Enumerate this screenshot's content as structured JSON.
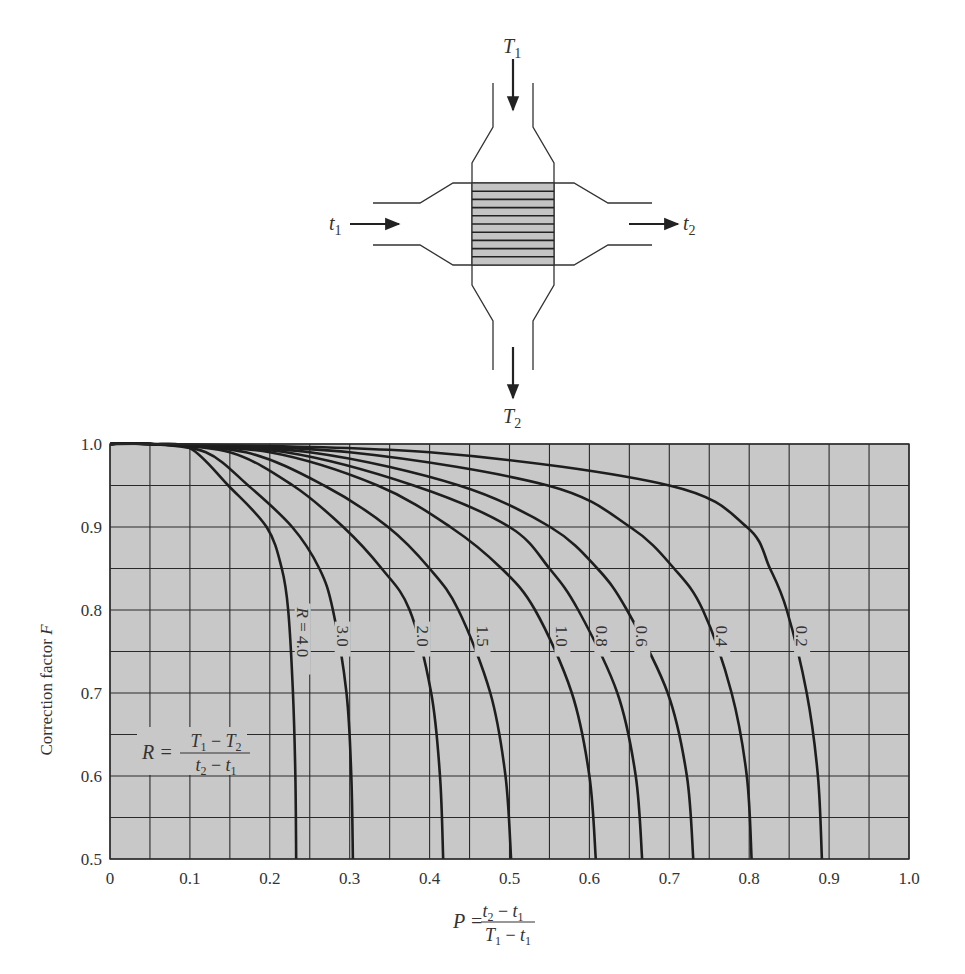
{
  "diagram": {
    "hot_inlet_label": "T",
    "hot_inlet_sub": "1",
    "hot_outlet_label": "T",
    "hot_outlet_sub": "2",
    "cold_inlet_label": "t",
    "cold_inlet_sub": "1",
    "cold_outlet_label": "t",
    "cold_outlet_sub": "2",
    "tube_count": 9
  },
  "chart": {
    "background": "#c8c8c8",
    "grid_color": "#2a2a2a",
    "curve_color": "#1e1e1e",
    "ylabel": "Correction factor F",
    "ylabel_main": "Correction factor ",
    "ylabel_var": "F",
    "xlabel": "P = (t2 - t1)/(T1 - t1)",
    "p_formula": {
      "lhs": "P =",
      "num_a": "t",
      "num_a_sub": "2",
      "num_op": " − ",
      "num_b": "t",
      "num_b_sub": "1",
      "den_a": "T",
      "den_a_sub": "1",
      "den_op": " − ",
      "den_b": "t",
      "den_b_sub": "1"
    },
    "r_formula": {
      "lhs": "R =",
      "num_a": "T",
      "num_a_sub": "1",
      "num_op": " − ",
      "num_b": "T",
      "num_b_sub": "2",
      "den_a": "t",
      "den_a_sub": "2",
      "den_op": " − ",
      "den_b": "t",
      "den_b_sub": "1"
    },
    "x_ticks": [
      "0",
      "0.1",
      "0.2",
      "0.3",
      "0.4",
      "0.5",
      "0.6",
      "0.7",
      "0.8",
      "0.9",
      "1.0"
    ],
    "y_ticks": [
      "1.0",
      "0.9",
      "0.8",
      "0.7",
      "0.6",
      "0.5"
    ]
  },
  "chart_data": {
    "type": "line",
    "title": "",
    "xlabel": "P = (t2 - t1)/(T1 - t1)",
    "ylabel": "Correction factor F",
    "xlim": [
      0,
      1.0
    ],
    "ylim": [
      0.5,
      1.0
    ],
    "grid": true,
    "grid_step_x": 0.05,
    "grid_step_y": 0.05,
    "legend": "inline labels on curves; parameter R = (T1 - T2)/(t2 - t1)",
    "series": [
      {
        "name": "R = 4.0",
        "label": "R = 4.0",
        "points": [
          [
            0.05,
            1.0
          ],
          [
            0.1,
            0.995
          ],
          [
            0.148,
            0.95
          ],
          [
            0.196,
            0.9
          ],
          [
            0.215,
            0.85
          ],
          [
            0.223,
            0.8
          ],
          [
            0.229,
            0.7
          ],
          [
            0.232,
            0.6
          ],
          [
            0.233,
            0.5
          ]
        ]
      },
      {
        "name": "R = 3.0",
        "label": "3.0",
        "points": [
          [
            0.05,
            1.0
          ],
          [
            0.12,
            0.99
          ],
          [
            0.173,
            0.95
          ],
          [
            0.228,
            0.9
          ],
          [
            0.262,
            0.85
          ],
          [
            0.279,
            0.8
          ],
          [
            0.296,
            0.7
          ],
          [
            0.302,
            0.6
          ],
          [
            0.304,
            0.5
          ]
        ]
      },
      {
        "name": "R = 2.0",
        "label": "2.0",
        "points": [
          [
            0.05,
            1.0
          ],
          [
            0.15,
            0.99
          ],
          [
            0.229,
            0.95
          ],
          [
            0.292,
            0.9
          ],
          [
            0.34,
            0.85
          ],
          [
            0.375,
            0.8
          ],
          [
            0.402,
            0.7
          ],
          [
            0.413,
            0.6
          ],
          [
            0.417,
            0.5
          ]
        ]
      },
      {
        "name": "R = 1.5",
        "label": "1.5",
        "points": [
          [
            0.05,
            1.0
          ],
          [
            0.17,
            0.99
          ],
          [
            0.268,
            0.95
          ],
          [
            0.348,
            0.9
          ],
          [
            0.4,
            0.85
          ],
          [
            0.436,
            0.8
          ],
          [
            0.476,
            0.7
          ],
          [
            0.495,
            0.6
          ],
          [
            0.502,
            0.5
          ]
        ]
      },
      {
        "name": "R = 1.0",
        "label": "1.0",
        "points": [
          [
            0.05,
            1.0
          ],
          [
            0.2,
            0.99
          ],
          [
            0.335,
            0.95
          ],
          [
            0.426,
            0.9
          ],
          [
            0.49,
            0.85
          ],
          [
            0.532,
            0.8
          ],
          [
            0.578,
            0.7
          ],
          [
            0.6,
            0.6
          ],
          [
            0.608,
            0.5
          ]
        ]
      },
      {
        "name": "R = 0.8",
        "label": "0.8",
        "points": [
          [
            0.05,
            1.0
          ],
          [
            0.22,
            0.99
          ],
          [
            0.38,
            0.95
          ],
          [
            0.5,
            0.9
          ],
          [
            0.55,
            0.85
          ],
          [
            0.586,
            0.8
          ],
          [
            0.635,
            0.7
          ],
          [
            0.658,
            0.6
          ],
          [
            0.666,
            0.5
          ]
        ]
      },
      {
        "name": "R = 0.6",
        "label": "0.6",
        "points": [
          [
            0.05,
            1.0
          ],
          [
            0.25,
            0.99
          ],
          [
            0.437,
            0.95
          ],
          [
            0.551,
            0.9
          ],
          [
            0.61,
            0.85
          ],
          [
            0.647,
            0.8
          ],
          [
            0.698,
            0.7
          ],
          [
            0.722,
            0.6
          ],
          [
            0.73,
            0.5
          ]
        ]
      },
      {
        "name": "R = 0.4",
        "label": "0.4",
        "points": [
          [
            0.05,
            1.0
          ],
          [
            0.3,
            0.99
          ],
          [
            0.548,
            0.95
          ],
          [
            0.651,
            0.9
          ],
          [
            0.706,
            0.85
          ],
          [
            0.742,
            0.8
          ],
          [
            0.778,
            0.7
          ],
          [
            0.797,
            0.6
          ],
          [
            0.803,
            0.5
          ]
        ]
      },
      {
        "name": "R = 0.2",
        "label": "0.2",
        "points": [
          [
            0.05,
            1.0
          ],
          [
            0.4,
            0.99
          ],
          [
            0.7,
            0.95
          ],
          [
            0.797,
            0.9
          ],
          [
            0.826,
            0.85
          ],
          [
            0.847,
            0.8
          ],
          [
            0.872,
            0.7
          ],
          [
            0.886,
            0.6
          ],
          [
            0.891,
            0.5
          ]
        ]
      }
    ],
    "x_tick_labels": [
      "0",
      "0.1",
      "0.2",
      "0.3",
      "0.4",
      "0.5",
      "0.6",
      "0.7",
      "0.8",
      "0.9",
      "1.0"
    ],
    "y_tick_labels": [
      "0.5",
      "0.6",
      "0.7",
      "0.8",
      "0.9",
      "1.0"
    ],
    "annotations": [
      "R = (T1 - T2)/(t2 - t1)",
      "P = (t2 - t1)/(T1 - t1)"
    ]
  }
}
